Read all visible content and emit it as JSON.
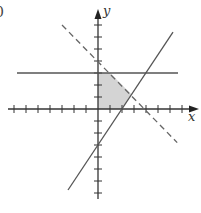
{
  "fragment_label": "0",
  "chart_data": {
    "type": "line",
    "title": "",
    "xlabel": "x",
    "ylabel": "y",
    "xlim": [
      -7.5,
      8
    ],
    "ylim": [
      -7.5,
      8
    ],
    "grid": false,
    "origin_px": [
      98,
      109
    ],
    "unit_px": 12,
    "x_ticks": [
      -7,
      -6,
      -5,
      -4,
      -3,
      -2,
      -1,
      1,
      2,
      3,
      4,
      5,
      6,
      7
    ],
    "y_ticks": [
      -7,
      -6,
      -5,
      -4,
      -3,
      -2,
      -1,
      1,
      2,
      3,
      4,
      5,
      6,
      7
    ],
    "series": [
      {
        "name": "y = 3",
        "style": "solid",
        "color": "#555555",
        "points": [
          [
            -6.75,
            3
          ],
          [
            6.67,
            3
          ]
        ]
      },
      {
        "name": "x + y = 4",
        "style": "dashed",
        "color": "#666666",
        "points": [
          [
            -3,
            7
          ],
          [
            6.6,
            -2.8
          ]
        ]
      },
      {
        "name": "y = 1.5x - 3",
        "style": "solid",
        "color": "#555555",
        "points": [
          [
            -2.5,
            -6.75
          ],
          [
            6.25,
            6.4
          ]
        ]
      }
    ],
    "shaded_region": {
      "color": "#d4d4d4",
      "vertices": [
        [
          0,
          0
        ],
        [
          0,
          3
        ],
        [
          1,
          3
        ],
        [
          2.8,
          1.2
        ],
        [
          2,
          0
        ]
      ]
    }
  }
}
